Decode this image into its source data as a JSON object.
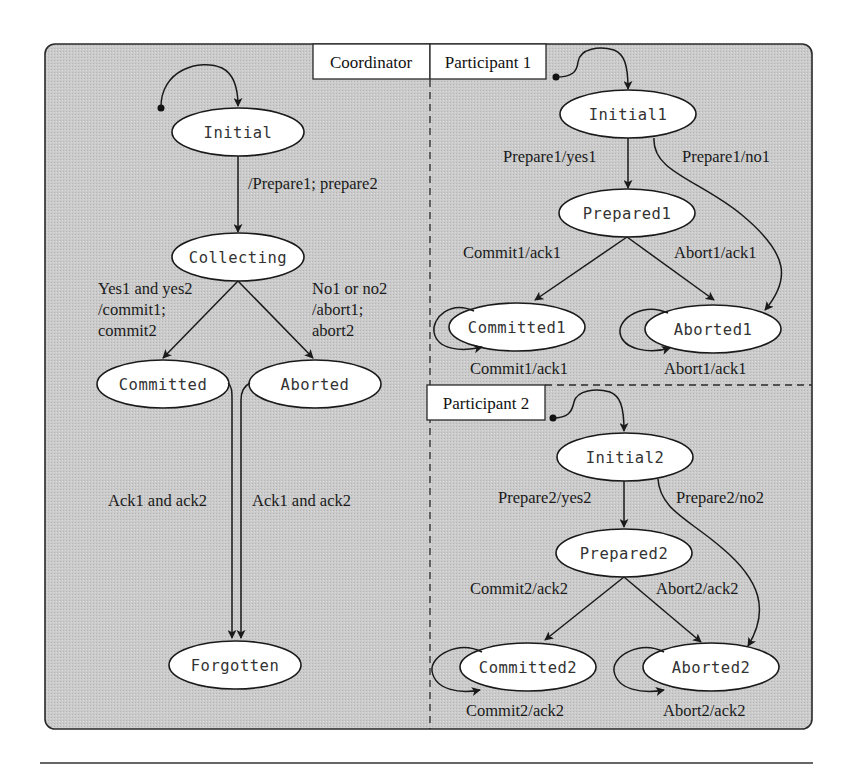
{
  "diagram": {
    "colors": {
      "panel_background": "#c9c9c9",
      "panel_border": "#2a2a2a",
      "state_fill": "#ffffff",
      "line": "#1a1a1a"
    },
    "lanes": {
      "coordinator": "Coordinator",
      "participant1": "Participant 1",
      "participant2": "Participant 2"
    },
    "coordinator": {
      "states": {
        "initial": "Initial",
        "collecting": "Collecting",
        "committed": "Committed",
        "aborted": "Aborted",
        "forgotten": "Forgotten"
      },
      "transitions": {
        "initial_to_collecting": "/Prepare1; prepare2",
        "collecting_to_committed": [
          "Yes1 and yes2",
          "/commit1;",
          "commit2"
        ],
        "collecting_to_aborted": [
          "No1 or no2",
          "/abort1;",
          "abort2"
        ],
        "committed_to_forgotten": "Ack1 and ack2",
        "aborted_to_forgotten": "Ack1 and ack2"
      }
    },
    "participant1": {
      "states": {
        "initial": "Initial1",
        "prepared": "Prepared1",
        "committed": "Committed1",
        "aborted": "Aborted1"
      },
      "transitions": {
        "initial_to_prepared": "Prepare1/yes1",
        "initial_to_aborted": "Prepare1/no1",
        "prepared_to_committed": "Commit1/ack1",
        "prepared_to_aborted": "Abort1/ack1",
        "committed_self": "Commit1/ack1",
        "aborted_self": "Abort1/ack1"
      }
    },
    "participant2": {
      "states": {
        "initial": "Initial2",
        "prepared": "Prepared2",
        "committed": "Committed2",
        "aborted": "Aborted2"
      },
      "transitions": {
        "initial_to_prepared": "Prepare2/yes2",
        "initial_to_aborted": "Prepare2/no2",
        "prepared_to_committed": "Commit2/ack2",
        "prepared_to_aborted": "Abort2/ack2",
        "committed_self": "Commit2/ack2",
        "aborted_self": "Abort2/ack2"
      }
    }
  }
}
